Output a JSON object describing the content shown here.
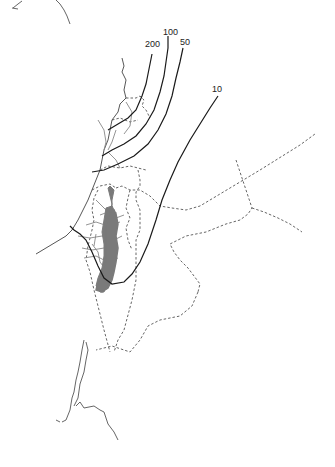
{
  "map": {
    "type": "isoline-map",
    "contour_labels": [
      {
        "value": "200",
        "x": 147,
        "y": 45
      },
      {
        "value": "100",
        "x": 165,
        "y": 31
      },
      {
        "value": "50",
        "x": 180,
        "y": 42
      },
      {
        "value": "10",
        "x": 212,
        "y": 88
      }
    ],
    "colors": {
      "contour": "#1a1a1a",
      "border": "#555555",
      "coast": "#444444",
      "rivers": "#888888",
      "shaded_region": "#7a7a7a"
    },
    "legend": null
  }
}
